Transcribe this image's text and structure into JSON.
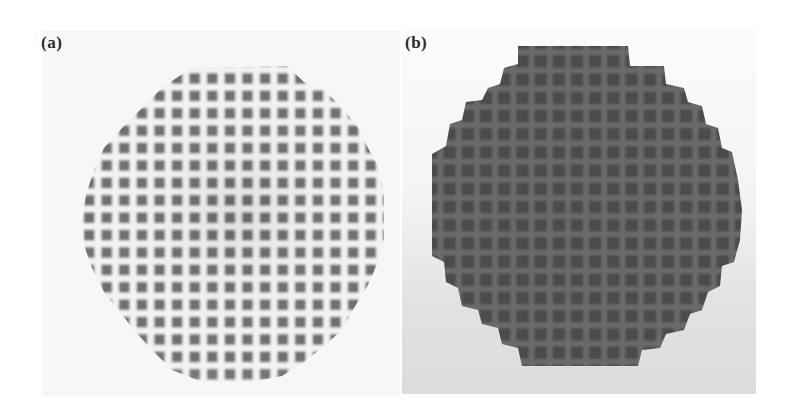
{
  "figure": {
    "panels": [
      {
        "label": "(a)",
        "subject": "white ceramic honeycomb monolith, square channels, end view",
        "colors": {
          "background": "#f7f7f7",
          "wall": "#f2f2f2",
          "channel": "#6f6f6f"
        }
      },
      {
        "label": "(b)",
        "subject": "dark coated honeycomb monolith, square channels, end view",
        "colors": {
          "background": "#e6e6e6",
          "body": "#555555",
          "channel": "#4a4a4a",
          "wall": "#6c6c6c"
        }
      }
    ]
  }
}
